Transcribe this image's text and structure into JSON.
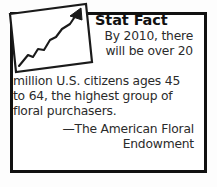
{
  "callout": {
    "title": "Stat Fact",
    "body_lead": "By 2010, there will be over 20",
    "body_rest": "million U.S. citizens ages 45 to 64, the highest group of floral purchasers.",
    "attribution": "—The American Floral Endowment",
    "icon": "rising-chart-arrow-icon"
  },
  "colors": {
    "border": "#111111",
    "title_text": "#111111",
    "body_text": "#2b2b2b",
    "background": "#ffffff",
    "icon_stroke": "#1a1a1a"
  }
}
